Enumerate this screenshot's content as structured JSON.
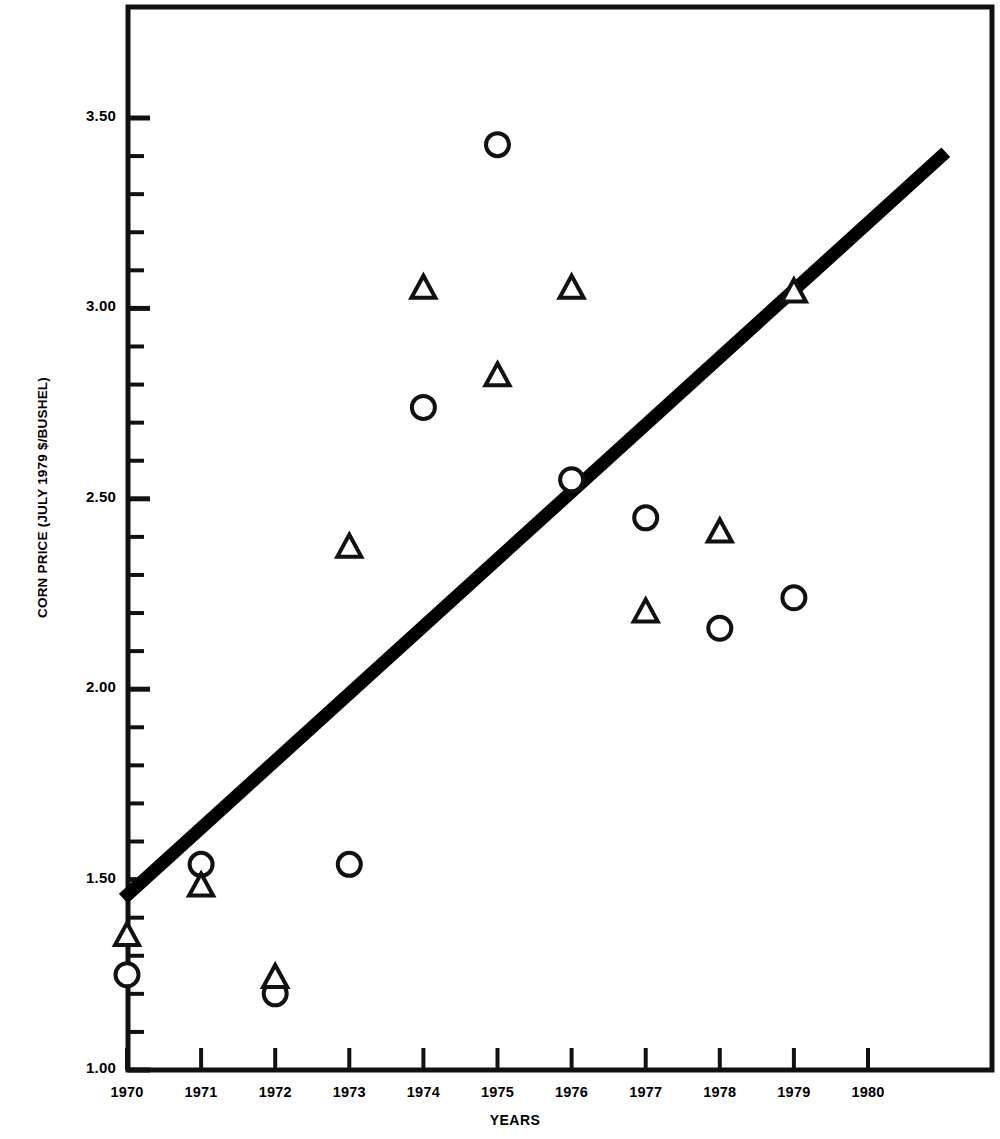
{
  "chart_data": {
    "type": "scatter",
    "title": "",
    "xlabel": "YEARS",
    "ylabel": "CORN PRICE (JULY 1979 $/BUSHEL)",
    "xlim": [
      1969.5,
      1981.2
    ],
    "ylim": [
      1.0,
      3.6
    ],
    "grid": false,
    "legend": "none",
    "x_tick_labels": [
      "1970",
      "1971",
      "1972",
      "1973",
      "1974",
      "1975",
      "1976",
      "1977",
      "1978",
      "1979",
      "1980"
    ],
    "x_ticks": [
      1970,
      1971,
      1972,
      1973,
      1974,
      1975,
      1976,
      1977,
      1978,
      1979,
      1980
    ],
    "y_tick_labels": [
      "1.00",
      "1.50",
      "2.00",
      "2.50",
      "3.00",
      "3.50"
    ],
    "y_ticks": [
      1.0,
      1.5,
      2.0,
      2.5,
      3.0,
      3.5
    ],
    "y_minor_tick_step": 0.1,
    "series": [
      {
        "name": "circle-series",
        "marker": "circle",
        "x": [
          1970,
          1971,
          1972,
          1973,
          1974,
          1975,
          1976,
          1977,
          1978,
          1979
        ],
        "values": [
          1.25,
          1.54,
          1.2,
          1.54,
          2.74,
          3.43,
          2.55,
          2.45,
          2.16,
          2.24
        ]
      },
      {
        "name": "triangle-series",
        "marker": "triangle",
        "x": [
          1970,
          1971,
          1972,
          1973,
          1974,
          1975,
          1976,
          1977,
          1978,
          1979
        ],
        "values": [
          1.35,
          1.48,
          1.24,
          2.37,
          3.05,
          2.82,
          3.05,
          2.2,
          2.41,
          3.04
        ]
      }
    ],
    "trend_line": {
      "name": "trend-line",
      "x": [
        1969.95,
        1981.05
      ],
      "values": [
        1.45,
        3.41
      ],
      "style": "thick-solid-black"
    }
  },
  "axes": {
    "y_label_text": "CORN PRICE (JULY 1979 $/BUSHEL)",
    "x_label_text": "YEARS"
  }
}
